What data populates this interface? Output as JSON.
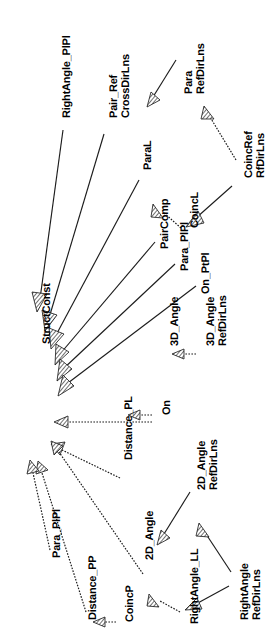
{
  "diagram": {
    "type": "uml-generalization",
    "orientation": "rotated-90-ccw",
    "root": "StructConst",
    "edge_style": "hatched-triangle-arrowhead",
    "colors": {
      "background": "#ffffff",
      "line": "#1c1c1c",
      "text": "#000000",
      "arrow_fill": "#ffffff"
    },
    "nodes": [
      {
        "id": "structconst",
        "label": "StructConst",
        "label2": "",
        "x": 42,
        "y": 344
      },
      {
        "id": "rightangle_plpl",
        "label": "RightAngle_PlPl",
        "label2": "",
        "x": 62,
        "y": 118
      },
      {
        "id": "pair_ref",
        "label": "Pair_Ref",
        "label2": "CrossDirLns",
        "x": 108,
        "y": 118
      },
      {
        "id": "paral",
        "label": "ParaL",
        "label2": "",
        "x": 143,
        "y": 170
      },
      {
        "id": "para",
        "label": "Para",
        "label2": "RefDirLns",
        "x": 183,
        "y": 94
      },
      {
        "id": "coincref",
        "label": "CoincRef",
        "label2": "RfDirLns",
        "x": 243,
        "y": 178
      },
      {
        "id": "coincl",
        "label": "CoincL",
        "label2": "",
        "x": 190,
        "y": 228
      },
      {
        "id": "paircomp",
        "label": "PairComp",
        "label2": "",
        "x": 160,
        "y": 249
      },
      {
        "id": "para_plpl",
        "label": "Para_PlPl",
        "label2": "",
        "x": 180,
        "y": 271
      },
      {
        "id": "on_ptpl",
        "label": "On_PtPl",
        "label2": "",
        "x": 201,
        "y": 294
      },
      {
        "id": "3d_angle",
        "label": "3D_Angle",
        "label2": "",
        "x": 170,
        "y": 346
      },
      {
        "id": "3d_angle_refdirlns",
        "label": "3D_Angle",
        "label2": "RefDirLns",
        "x": 205,
        "y": 346
      },
      {
        "id": "distance_pl",
        "label": "Distance_PL",
        "label2": "",
        "x": 124,
        "y": 460
      },
      {
        "id": "on",
        "label": "On",
        "label2": "",
        "x": 162,
        "y": 415
      },
      {
        "id": "para_plpl_2",
        "label": "Para_PlPl",
        "label2": "",
        "x": 52,
        "y": 558
      },
      {
        "id": "distance_pp",
        "label": "Distance_PP",
        "label2": "",
        "x": 88,
        "y": 620
      },
      {
        "id": "coincp",
        "label": "CoincP",
        "label2": "",
        "x": 125,
        "y": 622
      },
      {
        "id": "2d_angle",
        "label": "2D_Angle",
        "label2": "",
        "x": 145,
        "y": 560
      },
      {
        "id": "2d_angle_refdirlns",
        "label": "2D_Angle",
        "label2": "RefDirLns",
        "x": 196,
        "y": 490
      },
      {
        "id": "rightangle_ll",
        "label": "RightAngle_LL",
        "label2": "",
        "x": 190,
        "y": 624
      },
      {
        "id": "rightangle_refdirlns",
        "label": "RightAngle",
        "label2": "RefDirLns",
        "x": 239,
        "y": 620
      }
    ],
    "edges": [
      {
        "from": "rightangle_plpl",
        "to": "structconst",
        "style": "solid"
      },
      {
        "from": "pair_ref",
        "to": "structconst",
        "style": "solid"
      },
      {
        "from": "paral",
        "to": "structconst",
        "style": "solid"
      },
      {
        "from": "paircomp",
        "to": "structconst",
        "style": "solid"
      },
      {
        "from": "para_plpl",
        "to": "structconst",
        "style": "solid"
      },
      {
        "from": "on_ptpl",
        "to": "structconst",
        "style": "solid"
      },
      {
        "from": "3d_angle",
        "to": "structconst",
        "style": "dashed"
      },
      {
        "from": "distance_pl",
        "to": "structconst",
        "style": "dashed"
      },
      {
        "from": "para_plpl_2",
        "to": "structconst",
        "style": "dashed"
      },
      {
        "from": "distance_pp",
        "to": "structconst",
        "style": "dashed"
      },
      {
        "from": "2d_angle",
        "to": "structconst",
        "style": "dashed"
      },
      {
        "from": "para",
        "to": "paral",
        "style": "solid"
      },
      {
        "from": "coincref",
        "to": "para",
        "style": "dashed"
      },
      {
        "from": "coincref",
        "to": "coincl",
        "style": "solid"
      },
      {
        "from": "coincl",
        "to": "paircomp",
        "style": "dashed"
      },
      {
        "from": "3d_angle_refdirlns",
        "to": "3d_angle",
        "style": "dashed"
      },
      {
        "from": "on",
        "to": "distance_pl",
        "style": "dashed"
      },
      {
        "from": "2d_angle_refdirlns",
        "to": "2d_angle",
        "style": "solid"
      },
      {
        "from": "rightangle_refdirlns",
        "to": "2d_angle_refdirlns",
        "style": "solid"
      },
      {
        "from": "rightangle_refdirlns",
        "to": "rightangle_ll",
        "style": "solid"
      },
      {
        "from": "rightangle_ll",
        "to": "2d_angle",
        "style": "dashed"
      },
      {
        "from": "coincp",
        "to": "distance_pp",
        "style": "dashed"
      }
    ]
  }
}
